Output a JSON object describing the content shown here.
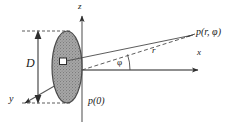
{
  "figure": {
    "background_color": "#ffffff",
    "line_color": "#3a3a3a",
    "disc_fill_color": "#9e9e9e",
    "disc_edge_color": "#4a4a4a",
    "marker_fill_color": "#ffffff"
  },
  "labels": {
    "z_axis": "z",
    "x_axis": "x",
    "y_axis": "y",
    "diameter": "D",
    "radius_ray": "r",
    "angle": "φ",
    "source_point": "p(0)",
    "field_point": "p(r, φ)"
  },
  "elements": {
    "disc_name": "scattering-disc",
    "marker_name": "source-element-marker",
    "angle_arc_name": "angle-arc",
    "dimension_name": "diameter-dimension"
  }
}
